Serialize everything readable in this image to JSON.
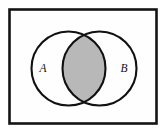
{
  "figure": {
    "name": "venn-diagram-intersection",
    "canvas": {
      "width": 167,
      "height": 134,
      "background": "#ffffff"
    },
    "frame": {
      "name": "universal-set-rectangle",
      "x": 9.5,
      "y": 9.5,
      "width": 147,
      "height": 114,
      "stroke": "#141414",
      "stroke_width": 2.6,
      "fill": "#fefefe"
    },
    "sets": [
      {
        "id": "A",
        "label": "A",
        "cx": 68.5,
        "cy": 68.5,
        "r": 37,
        "stroke": "#111111",
        "stroke_width": 2.1,
        "fill": "#ffffff",
        "label_x": 43,
        "label_y": 72
      },
      {
        "id": "B",
        "label": "B",
        "cx": 99.5,
        "cy": 68.5,
        "r": 37,
        "stroke": "#111111",
        "stroke_width": 2.1,
        "fill": "#ffffff",
        "label_x": 124,
        "label_y": 72
      }
    ],
    "intersection": {
      "name": "intersection-region",
      "description": "A intersect B",
      "fill": "#b8b8b8",
      "shaded": true
    }
  }
}
